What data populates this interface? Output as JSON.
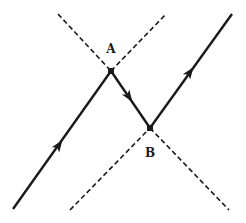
{
  "diagram": {
    "type": "ray-path-crossing",
    "colors": {
      "line": "#1a1a1a",
      "background": "#ffffff"
    },
    "points": [
      {
        "id": "A",
        "label": "A",
        "x": 111,
        "y": 71,
        "label_x": 111,
        "label_y": 53
      },
      {
        "id": "B",
        "label": "B",
        "x": 150,
        "y": 128,
        "label_x": 150,
        "label_y": 157
      }
    ],
    "solid_segments": [
      {
        "name": "incoming-ray",
        "x1": 13,
        "y1": 209,
        "x2": 111,
        "y2": 71
      },
      {
        "name": "transfer-ray",
        "x1": 111,
        "y1": 71,
        "x2": 150,
        "y2": 128
      },
      {
        "name": "outgoing-ray",
        "x1": 150,
        "y1": 128,
        "x2": 232,
        "y2": 14
      }
    ],
    "dashed_segments": [
      {
        "name": "dashed-line-upper-left",
        "x1": 58,
        "y1": 14,
        "x2": 111,
        "y2": 71
      },
      {
        "name": "dashed-line-upper-right",
        "x1": 111,
        "y1": 71,
        "x2": 166,
        "y2": 14
      },
      {
        "name": "dashed-line-lower-left",
        "x1": 70,
        "y1": 210,
        "x2": 150,
        "y2": 128
      },
      {
        "name": "dashed-line-lower-right",
        "x1": 150,
        "y1": 128,
        "x2": 229,
        "y2": 210
      }
    ],
    "arrows": [
      {
        "name": "arrow-incoming",
        "x": 59,
        "y": 145,
        "direction": "up-right"
      },
      {
        "name": "arrow-transfer",
        "x": 129,
        "y": 97,
        "direction": "down-right"
      },
      {
        "name": "arrow-outgoing",
        "x": 190,
        "y": 72,
        "direction": "up-right"
      }
    ]
  }
}
